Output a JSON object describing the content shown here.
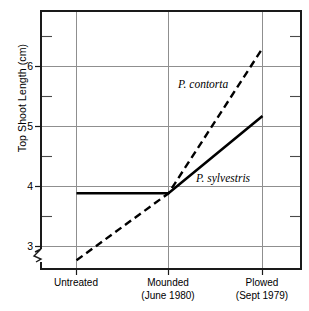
{
  "chart_data": {
    "type": "line",
    "title": "",
    "xlabel": "",
    "ylabel": "Top Shoot Length (cm)",
    "categories": [
      "Untreated",
      "Mounded",
      "Plowed"
    ],
    "category_sublabels": [
      "",
      "(June 1980)",
      "(Sept 1979)"
    ],
    "category_labels_full": [
      "Untreated",
      "Mounded (June 1980)",
      "Plowed (Sept 1979)"
    ],
    "ylim": [
      2.67,
      6.67
    ],
    "yticks": [
      3,
      4,
      5,
      6
    ],
    "ytick_labels": [
      "3",
      "4",
      "5",
      "6"
    ],
    "yminor_ticks": [
      3.5,
      4.5,
      5.5,
      6.5
    ],
    "grid": "both",
    "axis_break": true,
    "legend": "inline-annotations",
    "series": [
      {
        "name": "P. contorta",
        "style": "dashed",
        "values": [
          2.82,
          3.85,
          6.08
        ],
        "label_x_pct": 0.5,
        "label_y_value": 5.6
      },
      {
        "name": "P. sylvestris",
        "style": "solid",
        "values": [
          3.85,
          3.85,
          5.04
        ],
        "label_x_pct": 0.53,
        "label_y_value": 4.27
      }
    ],
    "colors": {
      "line": "#000000",
      "grid": "#8a8a8a",
      "frame": "#1a1a1a",
      "background": "#ffffff"
    }
  },
  "annotations": {
    "contorta_tag": "P. contorta",
    "sylvestris_tag": "P. sylvestris"
  },
  "axis": {
    "y_title": "Top Shoot Length (cm)",
    "y_tick_3": "3",
    "y_tick_4": "4",
    "y_tick_5": "5",
    "y_tick_6": "6",
    "x_cat_0_line1": "Untreated",
    "x_cat_0_line2": "",
    "x_cat_1_line1": "Mounded",
    "x_cat_1_line2": "(June 1980)",
    "x_cat_2_line1": "Plowed",
    "x_cat_2_line2": "(Sept 1979)"
  }
}
